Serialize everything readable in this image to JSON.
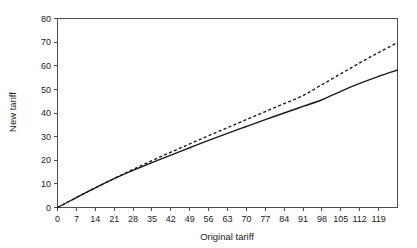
{
  "chart_data": {
    "type": "line",
    "title": "",
    "xlabel": "Original tariff",
    "ylabel": "New tariff",
    "xlim": [
      0,
      126
    ],
    "ylim": [
      0,
      80
    ],
    "grid": false,
    "legend": "none",
    "xticks": [
      0,
      7,
      14,
      21,
      28,
      35,
      42,
      49,
      56,
      63,
      70,
      77,
      84,
      91,
      98,
      105,
      112,
      119
    ],
    "yticks": [
      0,
      10,
      20,
      30,
      40,
      50,
      60,
      70,
      80
    ],
    "x": [
      0,
      7,
      14,
      21,
      28,
      35,
      42,
      49,
      56,
      63,
      70,
      77,
      84,
      91,
      98,
      105,
      112,
      119,
      126
    ],
    "series": [
      {
        "name": "dashed-reference",
        "style": "dashed",
        "color": "#1a1a1a",
        "values": [
          0,
          4.2,
          8.3,
          12.3,
          16.1,
          19.8,
          23.4,
          26.9,
          30.4,
          33.8,
          37.2,
          40.6,
          44.0,
          47.4,
          52.0,
          56.6,
          61.2,
          65.6,
          69.8
        ]
      },
      {
        "name": "solid-actual",
        "style": "solid",
        "color": "#1a1a1a",
        "values": [
          0,
          4.2,
          8.3,
          12.2,
          15.7,
          19.0,
          22.2,
          25.3,
          28.4,
          31.4,
          34.3,
          37.2,
          40.0,
          42.8,
          45.6,
          49.2,
          52.5,
          55.5,
          58.2
        ]
      }
    ]
  },
  "axes": {
    "x_title": "Original tariff",
    "y_title": "New tariff",
    "x_tick_labels": [
      "0",
      "7",
      "14",
      "21",
      "28",
      "35",
      "42",
      "49",
      "56",
      "63",
      "70",
      "77",
      "84",
      "91",
      "98",
      "105",
      "112",
      "119"
    ],
    "y_tick_labels": [
      "0",
      "10",
      "20",
      "30",
      "40",
      "50",
      "60",
      "70",
      "80"
    ]
  }
}
